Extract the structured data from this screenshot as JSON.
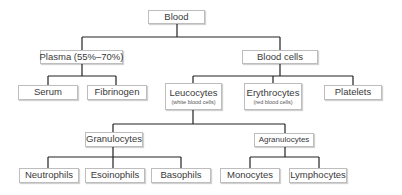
{
  "diagram": {
    "type": "tree",
    "line_color": "#222222",
    "nodes": {
      "blood": {
        "label": "Blood"
      },
      "plasma": {
        "label": "Plasma (55%–70%)"
      },
      "blood_cells": {
        "label": "Blood cells"
      },
      "serum": {
        "label": "Serum"
      },
      "fibrinogen": {
        "label": "Fibrinogen"
      },
      "leucocytes": {
        "label": "Leucocytes",
        "sublabel": "(white blood cells)"
      },
      "erythrocytes": {
        "label": "Erythrocytes",
        "sublabel": "(red blood cells)"
      },
      "platelets": {
        "label": "Platelets"
      },
      "granulocytes": {
        "label": "Granulocytes"
      },
      "agranulocytes": {
        "label": "Agranulocytes"
      },
      "neutrophils": {
        "label": "Neutrophils"
      },
      "esoinophils": {
        "label": "Esoinophils"
      },
      "basophils": {
        "label": "Basophils"
      },
      "monocytes": {
        "label": "Monocytes"
      },
      "lymphocytes": {
        "label": "Lymphocytes"
      }
    },
    "edges": [
      [
        "blood",
        "plasma"
      ],
      [
        "blood",
        "blood_cells"
      ],
      [
        "plasma",
        "serum"
      ],
      [
        "plasma",
        "fibrinogen"
      ],
      [
        "blood_cells",
        "leucocytes"
      ],
      [
        "blood_cells",
        "erythrocytes"
      ],
      [
        "blood_cells",
        "platelets"
      ],
      [
        "leucocytes",
        "granulocytes"
      ],
      [
        "leucocytes",
        "agranulocytes"
      ],
      [
        "granulocytes",
        "neutrophils"
      ],
      [
        "granulocytes",
        "esoinophils"
      ],
      [
        "granulocytes",
        "basophils"
      ],
      [
        "agranulocytes",
        "monocytes"
      ],
      [
        "agranulocytes",
        "lymphocytes"
      ]
    ]
  }
}
